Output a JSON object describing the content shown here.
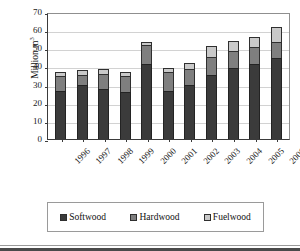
{
  "chart_data": {
    "type": "bar",
    "title": "",
    "subtitle": "",
    "stacked": true,
    "xlabel": "",
    "ylabel": "Million m",
    "ylabel_superscript": "3",
    "ylim": [
      0,
      70
    ],
    "ytick_step": 10,
    "yticks": [
      "70",
      "60",
      "50",
      "40",
      "30",
      "20",
      "10",
      "0"
    ],
    "grid": true,
    "grid_axis": "y",
    "legend_position": "bottom",
    "categories": [
      "1996",
      "1997",
      "1998",
      "1999",
      "2000",
      "2001",
      "2002",
      "2003",
      "2004",
      "2005",
      "2006"
    ],
    "series": [
      {
        "name": "Softwood",
        "color": "#3b3b3b",
        "values": [
          26.5,
          29.5,
          27.5,
          26.0,
          41.5,
          26.5,
          29.5,
          35.5,
          39.0,
          41.5,
          44.5
        ]
      },
      {
        "name": "Hardwood",
        "color": "#7f7f7f",
        "values": [
          8.5,
          6.0,
          8.5,
          9.0,
          10.5,
          10.5,
          9.0,
          9.5,
          9.5,
          9.0,
          9.0
        ]
      },
      {
        "name": "Fuelwood",
        "color": "#c9c9c9",
        "values": [
          2.0,
          2.5,
          2.5,
          2.0,
          1.5,
          2.0,
          3.5,
          6.0,
          5.5,
          6.0,
          8.5
        ]
      }
    ],
    "totals": [
      37.0,
      38.0,
      38.5,
      37.0,
      53.5,
      39.0,
      42.0,
      51.0,
      54.0,
      56.5,
      62.0
    ]
  },
  "legend": {
    "items": [
      {
        "label": "Softwood",
        "color": "#3b3b3b"
      },
      {
        "label": "Hardwood",
        "color": "#7f7f7f"
      },
      {
        "label": "Fuelwood",
        "color": "#c9c9c9"
      }
    ]
  }
}
